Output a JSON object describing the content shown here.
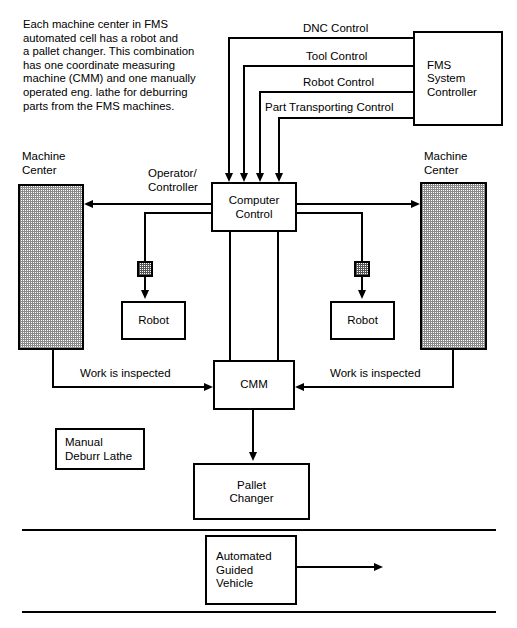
{
  "diagram": {
    "description": "Each machine center in FMS\nautomated cell has a robot and\na pallet changer. This combination\nhas one coordinate measuring\nmachine (CMM) and one manually\noperated eng. lathe for deburring\nparts from the FMS machines."
  },
  "control_lines": [
    {
      "label": "DNC Control"
    },
    {
      "label": "Tool Control"
    },
    {
      "label": "Robot Control"
    },
    {
      "label": "Part Transporting Control"
    }
  ],
  "nodes": {
    "fms_controller": "FMS\nSystem\nController",
    "computer_control": "Computer\nControl",
    "operator_controller": "Operator/\nController",
    "machine_center_left": "Machine\nCenter",
    "machine_center_right": "Machine\nCenter",
    "robot_left": "Robot",
    "robot_right": "Robot",
    "cmm": "CMM",
    "manual_deburr_lathe": "Manual\nDeburr Lathe",
    "pallet_changer": "Pallet\nChanger",
    "agv": "Automated\nGuided\nVehicle"
  },
  "edges": {
    "inspect_left": "Work is inspected",
    "inspect_right": "Work is inspected"
  },
  "colors": {
    "line": "#000000",
    "background": "#ffffff",
    "hatch": "#8a8a8a"
  }
}
